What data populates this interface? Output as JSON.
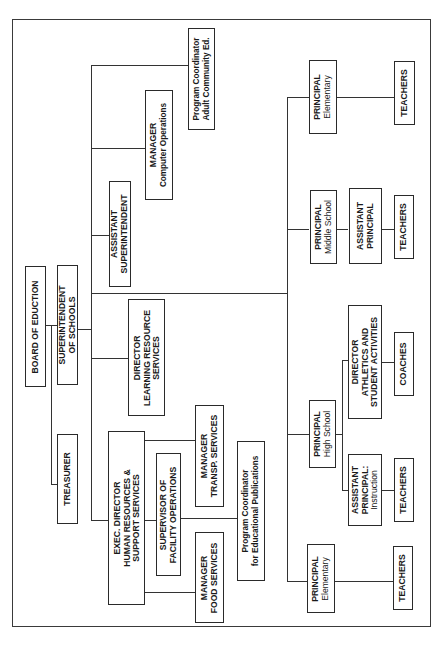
{
  "orientation": "rotated-90-counterclockwise",
  "nodes": {
    "board": {
      "lines": [
        "BOARD OF EDUCTION"
      ]
    },
    "superintendent": {
      "lines": [
        "SUPERINTENDENT",
        "OF SCHOOLS"
      ]
    },
    "treasurer": {
      "lines": [
        "TREASURER"
      ]
    },
    "asst_superintendent": {
      "lines": [
        "ASSISTANT",
        "SUPERINTENDENT"
      ]
    },
    "mgr_computer": {
      "lines": [
        "MANAGER",
        "Computer Operations"
      ]
    },
    "prog_coord_adult": {
      "lines": [
        "Program Coordinator",
        "Adult Community Ed."
      ]
    },
    "dir_learning": {
      "lines": [
        "DIRECTOR",
        "LEARNING RESOURCE",
        "SERVICES"
      ]
    },
    "exec_director": {
      "lines": [
        "EXEC. DIRECTOR",
        "HUMAN RESOURCES &",
        "SUPPORT SERVICES"
      ]
    },
    "sup_facility": {
      "lines": [
        "SUPERVISOR OF",
        "FACILITY OPERATIONS"
      ]
    },
    "mgr_transp": {
      "lines": [
        "MANAGER",
        "TRANSP. SERVICES"
      ]
    },
    "mgr_food": {
      "lines": [
        "MANAGER",
        "FOOD SERVICES"
      ]
    },
    "prog_coord_pub": {
      "lines": [
        "Program Coordinator",
        "for Educational Publications"
      ]
    },
    "principal_elem_1": {
      "lines": [
        "PRINCIPAL",
        "Elementary"
      ]
    },
    "teachers_elem_1": {
      "lines": [
        "TEACHERS"
      ]
    },
    "principal_ms": {
      "lines": [
        "PRINCIPAL",
        "Middle School"
      ]
    },
    "asst_principal_ms": {
      "lines": [
        "ASSISTANT",
        "PRINCIPAL"
      ]
    },
    "teachers_ms": {
      "lines": [
        "TEACHERS"
      ]
    },
    "principal_hs": {
      "lines": [
        "PRINCIPAL",
        "High School"
      ]
    },
    "dir_athletics": {
      "lines": [
        "DIRECTOR",
        "ATHLETICS AND",
        "STUDENT ACTIVITIES"
      ]
    },
    "coaches": {
      "lines": [
        "COACHES"
      ]
    },
    "asst_principal_hs": {
      "lines": [
        "ASSISTANT",
        "PRINCIPAL:",
        "Instruction"
      ]
    },
    "teachers_hs": {
      "lines": [
        "TEACHERS"
      ]
    },
    "principal_elem_2": {
      "lines": [
        "PRINCIPAL",
        "Elementary"
      ]
    },
    "teachers_elem_2": {
      "lines": [
        "TEACHERS"
      ]
    }
  },
  "edges": [
    [
      "board",
      "superintendent"
    ],
    [
      "board",
      "treasurer"
    ],
    [
      "superintendent",
      "asst_superintendent"
    ],
    [
      "superintendent",
      "dir_learning"
    ],
    [
      "superintendent",
      "exec_director"
    ],
    [
      "superintendent",
      "mgr_computer"
    ],
    [
      "superintendent",
      "prog_coord_adult"
    ],
    [
      "superintendent",
      "principal_elem_1"
    ],
    [
      "superintendent",
      "principal_ms"
    ],
    [
      "superintendent",
      "principal_hs"
    ],
    [
      "superintendent",
      "principal_elem_2"
    ],
    [
      "exec_director",
      "mgr_transp"
    ],
    [
      "exec_director",
      "sup_facility"
    ],
    [
      "exec_director",
      "mgr_food"
    ],
    [
      "sup_facility",
      "prog_coord_pub"
    ],
    [
      "principal_elem_1",
      "teachers_elem_1"
    ],
    [
      "principal_ms",
      "asst_principal_ms"
    ],
    [
      "asst_principal_ms",
      "teachers_ms"
    ],
    [
      "principal_hs",
      "dir_athletics"
    ],
    [
      "dir_athletics",
      "coaches"
    ],
    [
      "principal_hs",
      "asst_principal_hs"
    ],
    [
      "asst_principal_hs",
      "teachers_hs"
    ],
    [
      "principal_elem_2",
      "teachers_elem_2"
    ]
  ]
}
